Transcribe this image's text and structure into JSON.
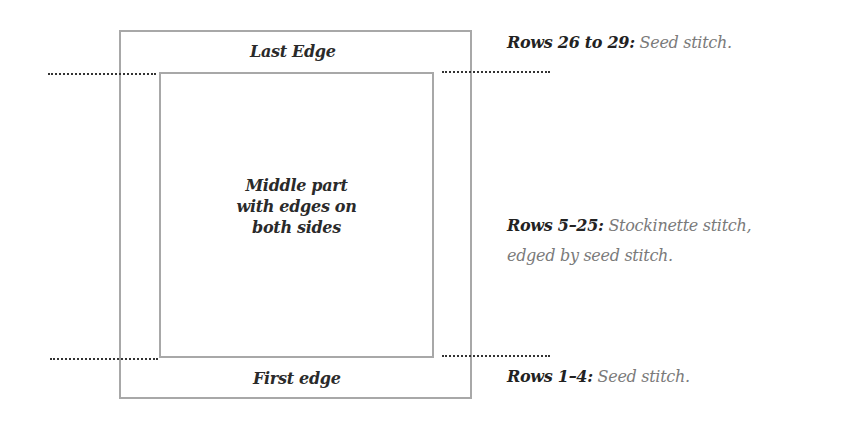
{
  "diagram": {
    "top_label": "Last Edge",
    "center_label_lines": [
      "Middle part",
      "with edges on",
      "both sides"
    ],
    "bottom_label": "First edge"
  },
  "notes": [
    {
      "rows": "Rows 26 to 29:",
      "description": " Seed stitch."
    },
    {
      "rows": "Rows 5–25:",
      "description": " Stockinette stitch,",
      "description_line2": "edged by seed stitch."
    },
    {
      "rows": "Rows 1–4:",
      "description": " Seed stitch."
    }
  ],
  "colors": {
    "box_border": "#a8a8a8",
    "dotted_line": "#333333",
    "label_text": "#2a2a2a",
    "description_text": "#7a7a7a"
  }
}
